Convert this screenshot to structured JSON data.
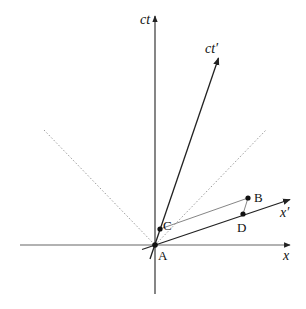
{
  "diagram": {
    "axes": {
      "ct": {
        "label": "ct",
        "from": [
          155,
          294
        ],
        "to": [
          155,
          15
        ],
        "label_pos": [
          140,
          24
        ]
      },
      "x": {
        "label": "x",
        "from": [
          20,
          245
        ],
        "to": [
          291,
          245
        ],
        "label_pos": [
          283,
          260
        ]
      },
      "ct_prime": {
        "label": "ct′",
        "from": [
          150,
          259
        ],
        "to": [
          219,
          57
        ],
        "label_pos": [
          205,
          53
        ]
      },
      "x_prime": {
        "label": "x′",
        "from": [
          142,
          249
        ],
        "to": [
          291,
          199
        ],
        "label_pos": [
          280,
          217
        ]
      }
    },
    "light_cone": {
      "left": {
        "from": [
          44,
          130
        ],
        "to": [
          155,
          245
        ],
        "style": "dashed"
      },
      "right": {
        "from": [
          155,
          245
        ],
        "to": [
          266,
          130
        ],
        "style": "dashed"
      }
    },
    "points": [
      {
        "id": "A",
        "label": "A",
        "pos": [
          155,
          245
        ],
        "label_pos": [
          159,
          260
        ]
      },
      {
        "id": "B",
        "label": "B",
        "pos": [
          248,
          198
        ],
        "label_pos": [
          254,
          197
        ]
      },
      {
        "id": "C",
        "label": "C",
        "pos": [
          160,
          229
        ],
        "label_pos": [
          165,
          226
        ]
      },
      {
        "id": "D",
        "label": "D",
        "pos": [
          243,
          214
        ],
        "label_pos": [
          237,
          230
        ]
      }
    ],
    "segments": [
      {
        "from": "C",
        "to": "B",
        "style": "thin"
      },
      {
        "from": "B",
        "to": "D",
        "style": "thin"
      },
      {
        "from": "A",
        "to": "C",
        "style": "light-dotted"
      }
    ]
  }
}
